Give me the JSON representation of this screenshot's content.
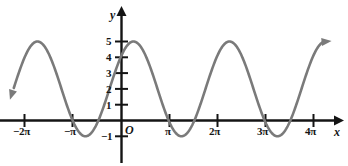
{
  "figure": {
    "kind": "cartesian-plot",
    "width": 348,
    "height": 166,
    "background_color": "#ffffff",
    "axis_color": "#141414",
    "curve_color": "#7a7a7a",
    "origin_label": "O",
    "x_axis_name": "x",
    "y_axis_name": "y"
  },
  "chart_data": {
    "type": "line",
    "title": "",
    "subtitle": "",
    "xlabel": "x",
    "ylabel": "y",
    "grid": false,
    "legend": null,
    "annotations": [],
    "origin_label": "O",
    "xlim": [
      -7.5,
      13.6
    ],
    "ylim": [
      -1.9,
      6.2
    ],
    "x_ticks": [
      -6.2832,
      -3.1416,
      3.1416,
      6.2832,
      9.4248,
      12.5664
    ],
    "x_tick_labels": [
      "−2π",
      "−π",
      "π",
      "2π",
      "3π",
      "4π"
    ],
    "y_ticks": [
      -1,
      1,
      2,
      3,
      4,
      5
    ],
    "y_tick_labels": [
      "−1",
      "1",
      "2",
      "3",
      "4",
      "5"
    ],
    "curve": {
      "expression": "y = 2 + 3 sin(x + pi/4)",
      "amplitude": 3,
      "vertical_shift": 2,
      "period": 6.2832,
      "phase_shift": 0.7854,
      "maximum": 5,
      "minimum": -1,
      "y_intercept": 2,
      "maxima_x": [
        -5.5,
        0.79,
        7.07
      ],
      "minima_x": [
        -2.36,
        3.93,
        10.21
      ],
      "arrow_start": "down-left",
      "arrow_end": "up-right"
    },
    "series": [
      {
        "name": "y = 2 + 3 sin(x + pi/4)",
        "x": [
          -7.2,
          -6.8,
          -6.4,
          -6.0,
          -5.6,
          -5.2,
          -4.8,
          -4.4,
          -4.0,
          -3.6,
          -3.2,
          -2.8,
          -2.4,
          -2.0,
          -1.6,
          -1.2,
          -0.8,
          -0.4,
          0.0,
          0.4,
          0.8,
          1.2,
          1.6,
          2.0,
          2.4,
          2.8,
          3.2,
          3.6,
          4.0,
          4.4,
          4.8,
          5.2,
          5.6,
          6.0,
          6.4,
          6.8,
          7.2,
          7.6,
          8.0,
          8.4,
          8.8,
          9.2,
          9.6,
          10.0,
          10.4,
          10.8,
          11.2,
          11.6,
          12.0,
          12.4,
          12.8,
          13.2
        ],
        "y": [
          1.43,
          2.59,
          3.62,
          4.4,
          4.87,
          4.98,
          4.72,
          4.13,
          3.28,
          2.27,
          1.24,
          0.33,
          -0.33,
          -0.74,
          -0.85,
          -0.66,
          -0.2,
          0.47,
          2.12,
          2.46,
          4.41,
          4.84,
          4.96,
          4.65,
          4.01,
          3.12,
          2.09,
          1.07,
          0.21,
          -0.39,
          -0.75,
          -0.83,
          -0.62,
          -0.15,
          0.54,
          1.41,
          2.38,
          3.38,
          4.22,
          4.78,
          4.99,
          4.82,
          4.31,
          3.53,
          2.58,
          1.58,
          0.69,
          0.02,
          -0.35,
          -0.42,
          -0.19,
          0.34
        ]
      }
    ]
  }
}
